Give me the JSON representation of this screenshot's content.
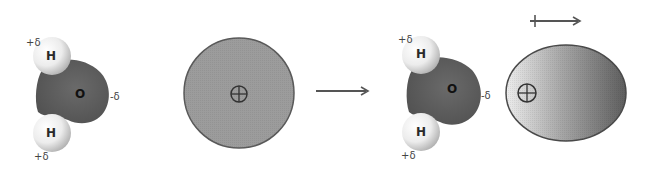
{
  "diagram": {
    "type": "ion-dipole induced polarization",
    "colors": {
      "hydrogen_light": "#f4f4f4",
      "hydrogen_dark": "#b8b8b8",
      "oxygen": "#5e5e5e",
      "ion_sphere": "#9a9a9a",
      "ion_outline": "#555555",
      "arrow": "#555555",
      "polarized_light": "#e6e6e6",
      "polarized_dark": "#6a6a6a"
    },
    "left_panel": {
      "water_molecule": {
        "hydrogen_top": {
          "label": "H",
          "charge": "+δ"
        },
        "oxygen": {
          "label": "O",
          "charge": "-δ"
        },
        "hydrogen_bottom": {
          "label": "H",
          "charge": "+δ"
        }
      },
      "ion": {
        "symbol": "⊕",
        "shape": "sphere"
      }
    },
    "reaction_arrow": {
      "direction": "right"
    },
    "right_panel": {
      "water_molecule": {
        "hydrogen_top": {
          "label": "H",
          "charge": "+δ"
        },
        "oxygen": {
          "label": "O",
          "charge": "-δ"
        },
        "hydrogen_bottom": {
          "label": "H",
          "charge": "+δ"
        }
      },
      "ion": {
        "symbol": "⊕",
        "shape": "polarized ellipse"
      },
      "dipole_arrow": {
        "direction": "right"
      }
    }
  }
}
